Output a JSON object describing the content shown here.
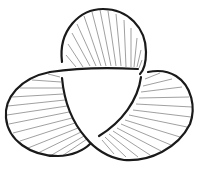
{
  "diagram": {
    "type": "trefoil-knot-ribbon",
    "lobes": [
      "top",
      "left",
      "right"
    ],
    "colors": {
      "edge": "#1a1a1a",
      "hatch": "#777777",
      "background": "#ffffff"
    }
  }
}
